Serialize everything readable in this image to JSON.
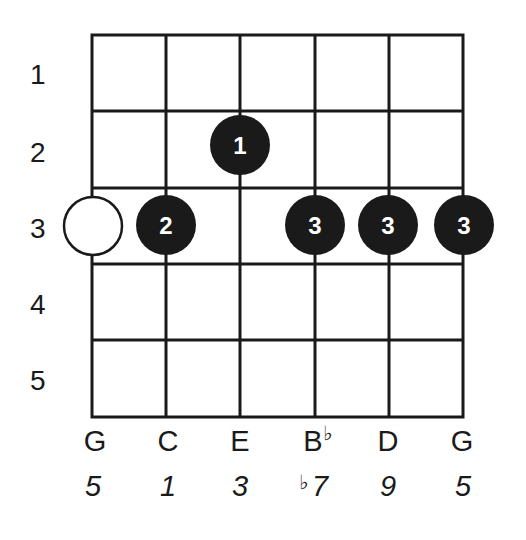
{
  "diagram": {
    "type": "guitar-chord-fretboard",
    "fret_numbers": [
      "1",
      "2",
      "3",
      "4",
      "5"
    ],
    "strings": [
      {
        "note": "G",
        "accidental": "",
        "interval": "5",
        "interval_accidental": ""
      },
      {
        "note": "C",
        "accidental": "",
        "interval": "1",
        "interval_accidental": ""
      },
      {
        "note": "E",
        "accidental": "",
        "interval": "3",
        "interval_accidental": ""
      },
      {
        "note": "B",
        "accidental": "♭",
        "interval": "7",
        "interval_accidental": "♭"
      },
      {
        "note": "D",
        "accidental": "",
        "interval": "9",
        "interval_accidental": ""
      },
      {
        "note": "G",
        "accidental": "",
        "interval": "5",
        "interval_accidental": ""
      }
    ],
    "dots": [
      {
        "string": 0,
        "fret": 3,
        "finger": "",
        "style": "open-circle"
      },
      {
        "string": 1,
        "fret": 3,
        "finger": "2",
        "style": "filled"
      },
      {
        "string": 2,
        "fret": 2,
        "finger": "1",
        "style": "filled"
      },
      {
        "string": 3,
        "fret": 3,
        "finger": "3",
        "style": "filled"
      },
      {
        "string": 4,
        "fret": 3,
        "finger": "3",
        "style": "filled"
      },
      {
        "string": 5,
        "fret": 3,
        "finger": "3",
        "style": "filled"
      }
    ],
    "colors": {
      "ink": "#1a1a1a",
      "background": "#ffffff",
      "finger_text": "#ffffff"
    }
  }
}
